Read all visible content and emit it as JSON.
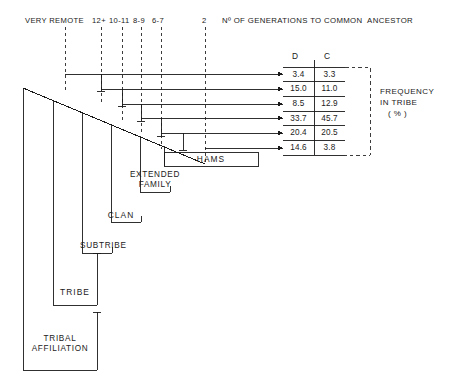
{
  "axis": {
    "title": "Nº OF GENERATIONS TO COMMON  ANCESTOR",
    "ticks": [
      {
        "label": "VERY REMOTE",
        "x": 65
      },
      {
        "label": "12+",
        "x": 101
      },
      {
        "label": "10-11",
        "x": 122
      },
      {
        "label": "8-9",
        "x": 141
      },
      {
        "label": "6-7",
        "x": 161
      },
      {
        "label": "2",
        "x": 205
      }
    ]
  },
  "table": {
    "columns": [
      "D",
      "C"
    ],
    "rows": [
      {
        "d": "3.4",
        "c": "3.3"
      },
      {
        "d": "15.0",
        "c": "11.0"
      },
      {
        "d": "8.5",
        "c": "12.9"
      },
      {
        "d": "33.7",
        "c": "45.7"
      },
      {
        "d": "20.4",
        "c": "20.5"
      },
      {
        "d": "14.6",
        "c": "3.8"
      }
    ]
  },
  "legend": {
    "line1": "FREQUENCY",
    "line2": "IN TRIBE",
    "line3": "( % )"
  },
  "boxes": [
    {
      "id": "hams",
      "label": "HAMS"
    },
    {
      "id": "extended",
      "label_line1": "EXTENDED",
      "label_line2": "FAMILY"
    },
    {
      "id": "clan",
      "label": "CLAN"
    },
    {
      "id": "subtribe",
      "label": "SUBTRIBE"
    },
    {
      "id": "tribe",
      "label": "TRIBE"
    },
    {
      "id": "affiliation",
      "label_line1": "TRIBAL",
      "label_line2": "AFFILIATION"
    }
  ],
  "style": {
    "ink": "#1a1a1a",
    "background": "#ffffff"
  }
}
